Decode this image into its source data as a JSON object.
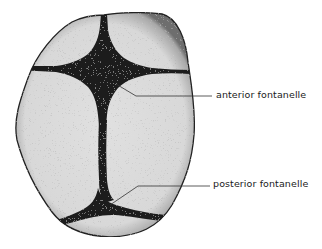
{
  "diagram": {
    "colors": {
      "bone_fill": "#dcdcdc",
      "suture_fill": "#1a1a1a",
      "outline": "#222222",
      "leader_line": "#333333",
      "background": "#ffffff"
    },
    "labels": [
      {
        "id": "anterior",
        "text": "anterior fontanelle"
      },
      {
        "id": "posterior",
        "text": "posterior fontanelle"
      }
    ]
  }
}
